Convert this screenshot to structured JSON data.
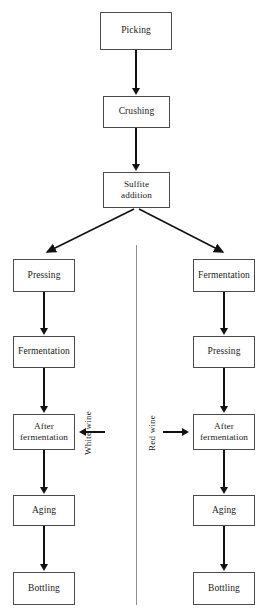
{
  "diagram": {
    "background_color": "#ffffff",
    "box_border_color": "#4a4a4a",
    "arrow_color": "#111111",
    "divider_color": "#8f8f8f",
    "common": {
      "picking": "Picking",
      "crushing": "Crushing",
      "sulfite_addition": "Sulfite\naddition"
    },
    "white_wine_branch": {
      "label": "White wine",
      "steps": [
        "Pressing",
        "Fermentation",
        "After\nfermentation",
        "Aging",
        "Bottling"
      ]
    },
    "red_wine_branch": {
      "label": "Red wine",
      "steps": [
        "Fermentation",
        "Pressing",
        "After\nfermentation",
        "Aging",
        "Bottling"
      ]
    }
  }
}
